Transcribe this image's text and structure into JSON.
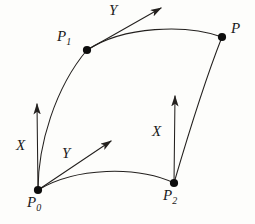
{
  "figure": {
    "kind": "geometric-diagram",
    "background_color": "#fdfdfb",
    "ink_color": "#23201e",
    "dot_color": "#0d0d0d",
    "width": 255,
    "height": 224
  },
  "points": [
    {
      "id": "P0",
      "base": "P",
      "subscript": "0",
      "x": 38,
      "y": 190,
      "label_x": 27,
      "label_y": 195
    },
    {
      "id": "P1",
      "base": "P",
      "subscript": "1",
      "x": 87,
      "y": 50,
      "label_x": 57,
      "label_y": 29
    },
    {
      "id": "P2",
      "base": "P",
      "subscript": "2",
      "x": 174,
      "y": 183,
      "label_x": 163,
      "label_y": 188
    },
    {
      "id": "P",
      "base": "P",
      "subscript": "",
      "x": 222,
      "y": 37,
      "label_x": 231,
      "label_y": 21
    }
  ],
  "vectors": [
    {
      "id": "X-at-P0",
      "label": "X",
      "from_x": 38,
      "from_y": 190,
      "to_x": 37,
      "to_y": 104,
      "label_x": 16,
      "label_y": 138
    },
    {
      "id": "Y-at-P0",
      "label": "Y",
      "from_x": 38,
      "from_y": 190,
      "to_x": 111,
      "to_y": 141,
      "label_x": 62,
      "label_y": 146
    },
    {
      "id": "X-at-P2",
      "label": "X",
      "from_x": 174,
      "from_y": 183,
      "to_x": 175,
      "to_y": 96,
      "label_x": 152,
      "label_y": 124
    },
    {
      "id": "Y-at-P1",
      "label": "Y",
      "from_x": 87,
      "from_y": 50,
      "to_x": 161,
      "to_y": 8,
      "label_x": 109,
      "label_y": 3
    }
  ],
  "curves": [
    {
      "id": "curve-P0-P1",
      "from": "P0",
      "to": "P1",
      "path": "M 38 190 C 38 145 55 88 87 50"
    },
    {
      "id": "curve-P1-P",
      "from": "P1",
      "to": "P",
      "path": "M 87 50 C 124 26 186 24 222 37"
    },
    {
      "id": "curve-P0-P2",
      "from": "P0",
      "to": "P2",
      "path": "M 38 190 C 76 167 137 166 174 183"
    },
    {
      "id": "curve-P2-P",
      "from": "P2",
      "to": "P",
      "path": "M 174 183 C 186 142 205 80 222 37"
    }
  ]
}
